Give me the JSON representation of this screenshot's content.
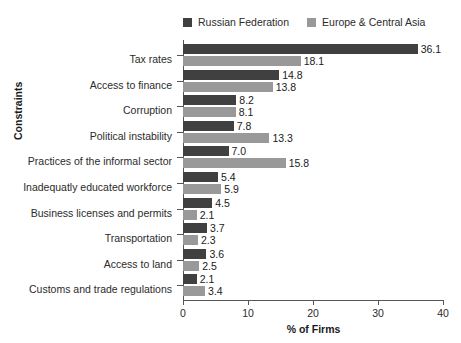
{
  "chart_data": {
    "type": "bar",
    "orientation": "horizontal",
    "title": "",
    "xlabel": "% of Firms",
    "ylabel": "Constraints",
    "xlim": [
      0,
      40
    ],
    "xticks": [
      0,
      10,
      20,
      30,
      40
    ],
    "xtick_labels": [
      "0",
      "10",
      "20",
      "30",
      "40"
    ],
    "grid": false,
    "legend_position": "top",
    "categories": [
      "Tax rates",
      "Access to finance",
      "Corruption",
      "Political instability",
      "Practices of the informal sector",
      "Inadequatly educated workforce",
      "Business licenses and permits",
      "Transportation",
      "Access to land",
      "Customs and trade regulations"
    ],
    "series": [
      {
        "name": "Russian Federation",
        "color": "#404040",
        "values": [
          36.1,
          14.8,
          8.2,
          7.8,
          7.0,
          5.4,
          4.5,
          3.7,
          3.6,
          2.1
        ],
        "value_labels": [
          "36.1",
          "14.8",
          "8.2",
          "7.8",
          "7.0",
          "5.4",
          "4.5",
          "3.7",
          "3.6",
          "2.1"
        ]
      },
      {
        "name": "Europe & Central Asia",
        "color": "#999999",
        "values": [
          18.1,
          13.8,
          8.1,
          13.3,
          15.8,
          5.9,
          2.1,
          2.3,
          2.5,
          3.4
        ],
        "value_labels": [
          "18.1",
          "13.8",
          "8.1",
          "13.3",
          "15.8",
          "5.9",
          "2.1",
          "2.3",
          "2.5",
          "3.4"
        ]
      }
    ]
  },
  "legend": {
    "entries": [
      {
        "label": "Russian Federation",
        "color": "#404040"
      },
      {
        "label": "Europe & Central Asia",
        "color": "#999999"
      }
    ]
  },
  "axes": {
    "x_title": "% of Firms",
    "y_title": "Constraints"
  }
}
